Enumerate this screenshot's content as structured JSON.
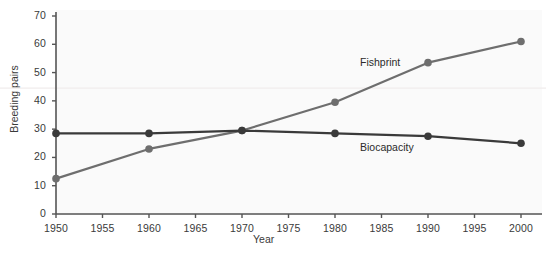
{
  "chart_data": {
    "type": "line",
    "title": "",
    "xlabel": "Year",
    "ylabel": "Breeding pairs",
    "xlim": [
      1950,
      2001
    ],
    "ylim": [
      0,
      72
    ],
    "grid": false,
    "legend_position": "inline-annotations",
    "x": [
      1950,
      1960,
      1970,
      1980,
      1990,
      2000
    ],
    "xticks": [
      "1950",
      "1955",
      "1960",
      "1965",
      "1970",
      "1975",
      "1980",
      "1985",
      "1990",
      "1995",
      "2000"
    ],
    "xtick_values": [
      1950,
      1955,
      1960,
      1965,
      1970,
      1975,
      1980,
      1985,
      1990,
      1995,
      2000
    ],
    "yticks": [
      "0",
      "10",
      "20",
      "30",
      "40",
      "50",
      "60",
      "70"
    ],
    "ytick_values": [
      0,
      10,
      20,
      30,
      40,
      50,
      60,
      70
    ],
    "series": [
      {
        "name": "Fishprint",
        "color": "#6e6e6e",
        "marker": "circle",
        "values": [
          12.5,
          23.0,
          29.5,
          39.5,
          53.5,
          61.0
        ]
      },
      {
        "name": "Biocapacity",
        "color": "#3a3a3a",
        "marker": "circle",
        "values": [
          28.5,
          28.5,
          29.5,
          28.5,
          27.5,
          25.0
        ]
      }
    ],
    "annotations": [
      {
        "text": "Fishprint",
        "x": 1984,
        "y": 47
      },
      {
        "text": "Biocapacity",
        "x": 1984,
        "y": 24
      }
    ],
    "colors": {
      "fishprint": "#6e6e6e",
      "biocapacity": "#3a3a3a",
      "axis": "#555555",
      "plot_background": "#fafafa",
      "page_background": "#ffffff",
      "faint_rule": "#f0ecec"
    }
  },
  "axes": {
    "y_title": "Breeding pairs",
    "x_title": "Year",
    "y_tick_labels": [
      "70",
      "60",
      "50",
      "40",
      "30",
      "20",
      "10",
      "0"
    ],
    "x_tick_labels": [
      "1950",
      "1955",
      "1960",
      "1965",
      "1970",
      "1975",
      "1980",
      "1985",
      "1990",
      "1995",
      "2000"
    ]
  },
  "labels": {
    "fishprint": "Fishprint",
    "biocapacity": "Biocapacity"
  }
}
